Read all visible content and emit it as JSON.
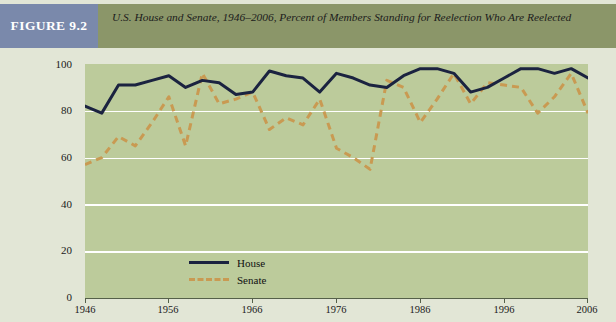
{
  "figure": {
    "label": "FIGURE 9.2",
    "title": "U.S. House and Senate, 1946–2006, Percent of Members Standing for Reelection Who Are Reelected",
    "label_bg": "#7a89ab",
    "header_bg": "#8b9669",
    "body_bg": "#e2e6d6",
    "plot_bg": "#bccb9b"
  },
  "legend": {
    "house_label": "House",
    "senate_label": "Senate",
    "house_color": "#1b2340",
    "senate_color": "#c99a52",
    "position": "inside-bottom-left"
  },
  "axes": {
    "y_ticks": [
      "0",
      "20",
      "40",
      "60",
      "80",
      "100"
    ],
    "x_ticks": [
      "1946",
      "1956",
      "1966",
      "1976",
      "1986",
      "1996",
      "2006"
    ]
  },
  "chart_data": {
    "type": "line",
    "title": "U.S. House and Senate, 1946–2006, Percent of Members Standing for Reelection Who Are Reelected",
    "xlabel": "",
    "ylabel": "",
    "xlim": [
      1946,
      2006
    ],
    "ylim": [
      0,
      100
    ],
    "ytick_values": [
      0,
      20,
      40,
      60,
      80,
      100
    ],
    "xtick_values": [
      1946,
      1956,
      1966,
      1976,
      1986,
      1996,
      2006
    ],
    "grid": "horizontal",
    "legend_position": "inside-bottom-left",
    "x": [
      1946,
      1948,
      1950,
      1952,
      1954,
      1956,
      1958,
      1960,
      1962,
      1964,
      1966,
      1968,
      1970,
      1972,
      1974,
      1976,
      1978,
      1980,
      1982,
      1984,
      1986,
      1988,
      1990,
      1992,
      1994,
      1996,
      1998,
      2000,
      2002,
      2004,
      2006
    ],
    "series": [
      {
        "name": "House",
        "style": "solid",
        "color": "#1b2340",
        "values": [
          82,
          79,
          91,
          91,
          93,
          95,
          90,
          93,
          92,
          87,
          88,
          97,
          95,
          94,
          88,
          96,
          94,
          91,
          90,
          95,
          98,
          98,
          96,
          88,
          90,
          94,
          98,
          98,
          96,
          98,
          94
        ]
      },
      {
        "name": "Senate",
        "style": "dashed",
        "color": "#c99a52",
        "values": [
          57,
          60,
          69,
          65,
          75,
          86,
          65,
          96,
          83,
          85,
          88,
          72,
          77,
          74,
          85,
          64,
          60,
          55,
          93,
          90,
          75,
          85,
          96,
          83,
          92,
          91,
          90,
          79,
          86,
          96,
          79
        ]
      }
    ]
  }
}
